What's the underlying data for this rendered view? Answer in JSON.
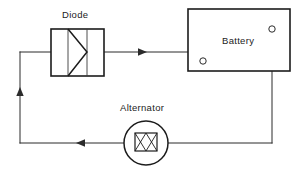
{
  "diagram": {
    "type": "circuit-schematic",
    "title_visible": false,
    "background_color": "#ffffff",
    "line_color": "#2b2b2b",
    "labels": {
      "diode": "Diode",
      "battery": "Battery",
      "alternator": "Alternator"
    },
    "components": [
      {
        "id": "diode",
        "label": "Diode",
        "shape": "rectangle-with-triangle",
        "terminals": 2
      },
      {
        "id": "battery",
        "label": "Battery",
        "shape": "rectangle",
        "terminals": 2
      },
      {
        "id": "alternator",
        "label": "Alternator",
        "shape": "circle-with-winding",
        "terminals": 2
      }
    ],
    "current_flow_arrows": [
      {
        "id": "arrow-top",
        "direction": "right",
        "segment": "diode-to-battery"
      },
      {
        "id": "arrow-bottom",
        "direction": "left",
        "segment": "alternator-to-left-rail"
      },
      {
        "id": "arrow-left",
        "direction": "up",
        "segment": "left-rail-to-diode"
      }
    ]
  }
}
